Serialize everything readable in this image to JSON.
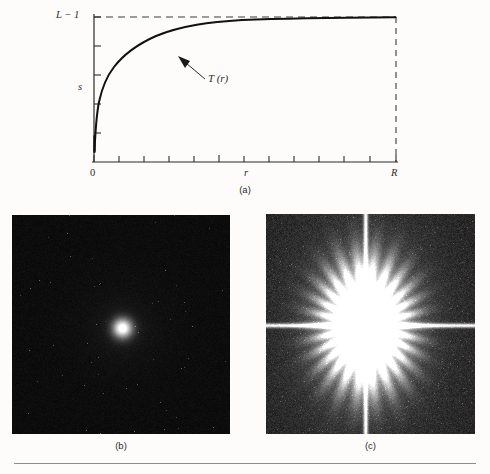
{
  "figure": {
    "background_color": "#fdfcfb",
    "rule_color": "#8d8d8d"
  },
  "panel_a": {
    "caption": "(a)",
    "labels": {
      "y_max": "L − 1",
      "y_value": "s",
      "origin": "0",
      "x_value": "r",
      "x_max": "R",
      "curve_annotation": "T (r)"
    },
    "axis": {
      "x_tick_count": 12,
      "y_tick_count": 4,
      "x_axis_color": "#2b2b2b",
      "y_axis_color": "#2b2b2b",
      "dashed_color": "#3a3a3a",
      "curve_color": "#111111",
      "grid": false
    }
  },
  "panel_b": {
    "caption": "(b)",
    "description": "fourier-spectrum-unscaled",
    "background_color": "#0a0a0a",
    "center_spot_color": "#ffffff",
    "center_spot_radius": 9,
    "noise_level": 0.08,
    "has_cross_lines": false
  },
  "panel_c": {
    "caption": "(c)",
    "description": "fourier-spectrum-log-transformed",
    "background_color": "#141414",
    "center_spot_color": "#ffffff",
    "blob_radius_x": 42,
    "blob_radius_y": 58,
    "noise_level": 0.26,
    "has_cross_lines": true,
    "cross_line_color": "#e8e8e8"
  },
  "chart_data": {
    "type": "line",
    "title": "",
    "xlabel": "r",
    "ylabel": "s",
    "xlim": [
      0,
      1
    ],
    "ylim": [
      0,
      1
    ],
    "xtick_labels": [
      "0",
      "R"
    ],
    "ytick_labels": [
      "L − 1"
    ],
    "grid": false,
    "annotations": [
      "T (r)"
    ],
    "series": [
      {
        "name": "T (r)",
        "x": [
          0.0,
          0.005,
          0.012,
          0.022,
          0.035,
          0.05,
          0.07,
          0.095,
          0.125,
          0.16,
          0.2,
          0.245,
          0.295,
          0.35,
          0.41,
          0.475,
          0.545,
          0.62,
          0.7,
          0.785,
          0.875,
          0.97,
          1.0
        ],
        "y": [
          0.0,
          0.12,
          0.218,
          0.306,
          0.383,
          0.444,
          0.503,
          0.558,
          0.609,
          0.654,
          0.695,
          0.732,
          0.767,
          0.799,
          0.829,
          0.856,
          0.881,
          0.905,
          0.927,
          0.948,
          0.967,
          0.986,
          1.0
        ]
      }
    ]
  }
}
